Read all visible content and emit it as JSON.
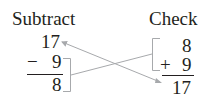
{
  "subtract": {
    "title": "Subtract",
    "minuend": "17",
    "operator": "−",
    "subtrahend": "9",
    "difference": "8"
  },
  "check": {
    "title": "Check",
    "addend1": "8",
    "operator": "+",
    "addend2": "9",
    "sum": "17"
  },
  "colors": {
    "text": "#231f20",
    "connector": "#a7a9ac"
  }
}
